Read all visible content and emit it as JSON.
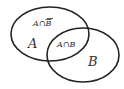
{
  "diagram": {
    "type": "venn",
    "sets": [
      {
        "id": "A",
        "label": "A",
        "cx": 50,
        "cy": 34,
        "rx": 39,
        "ry": 27
      },
      {
        "id": "B",
        "label": "B",
        "cx": 83,
        "cy": 54,
        "rx": 36,
        "ry": 27
      }
    ],
    "regions": {
      "a_only": "A∩",
      "a_only_bar": "B",
      "intersection": "A∩B"
    },
    "colors": {
      "stroke": "#222222",
      "text": "#333333",
      "background": "#ffffff"
    }
  }
}
